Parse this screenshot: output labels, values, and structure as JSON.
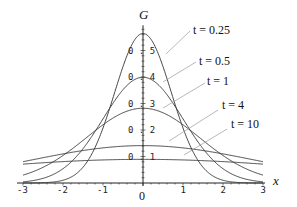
{
  "chart_data": {
    "type": "line",
    "title": "",
    "xlabel": "x",
    "ylabel": "G",
    "xlim": [
      -3,
      3
    ],
    "ylim": [
      0,
      0.6
    ],
    "grid": false,
    "x_ticks": [
      "-3",
      "-2",
      "-1",
      "0",
      "1",
      "2",
      "3"
    ],
    "y_ticks": [
      "0.1",
      "0.2",
      "0.3",
      "0.4",
      "0.5"
    ],
    "origin_label": "0",
    "formula": "G(x,t) = exp(-x^2/(4t)) / sqrt(4*pi*t)",
    "x": [
      -3,
      -2,
      -1,
      0,
      1,
      2,
      3
    ],
    "series": [
      {
        "name": "t = 0.25",
        "t": 0.25,
        "peak": 0.564,
        "values": [
          0.0001,
          0.01,
          0.208,
          0.564,
          0.208,
          0.01,
          0.0001
        ],
        "label_pos": [
          193,
          34
        ],
        "leader": [
          [
            190,
            31
          ],
          [
            166,
            54
          ]
        ]
      },
      {
        "name": "t = 0.5",
        "t": 0.5,
        "peak": 0.399,
        "values": [
          0.004,
          0.054,
          0.242,
          0.399,
          0.242,
          0.054,
          0.004
        ],
        "label_pos": [
          199,
          65
        ],
        "leader": [
          [
            196,
            62
          ],
          [
            163,
            82
          ]
        ]
      },
      {
        "name": "t = 1",
        "t": 1,
        "peak": 0.282,
        "values": [
          0.03,
          0.104,
          0.22,
          0.282,
          0.22,
          0.104,
          0.03
        ],
        "label_pos": [
          207,
          85
        ],
        "leader": [
          [
            205,
            83
          ],
          [
            163,
            108
          ]
        ]
      },
      {
        "name": "t = 4",
        "t": 4,
        "peak": 0.141,
        "values": [
          0.08,
          0.11,
          0.132,
          0.141,
          0.132,
          0.11,
          0.08
        ],
        "label_pos": [
          222,
          109
        ],
        "leader": [
          [
            218,
            110
          ],
          [
            169,
            141
          ]
        ]
      },
      {
        "name": "t = 10",
        "t": 10,
        "peak": 0.089,
        "values": [
          0.071,
          0.081,
          0.087,
          0.089,
          0.087,
          0.081,
          0.071
        ],
        "label_pos": [
          231,
          128
        ],
        "leader": [
          [
            227,
            129
          ],
          [
            184,
            155
          ]
        ]
      }
    ],
    "legend_position": "inline labels with leader lines, right side"
  },
  "plot": {
    "origin_px": [
      143,
      183
    ],
    "x_px_per_unit": 40,
    "y_px_per_unit": 265,
    "line_color": "#333333",
    "leader_color": "#999999"
  }
}
